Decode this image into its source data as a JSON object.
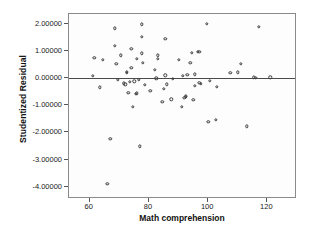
{
  "chart_data": {
    "type": "scatter",
    "title": "",
    "xlabel": "Math comprehension",
    "ylabel": "Studentized Residual",
    "xlim": [
      53,
      130
    ],
    "ylim": [
      -4.45,
      2.35
    ],
    "grid": false,
    "legend": null,
    "xticks": [
      60,
      80,
      100,
      120
    ],
    "xtick_labels": [
      "60",
      "80",
      "100",
      "120"
    ],
    "yticks": [
      2,
      1,
      0,
      -1,
      -2,
      -3,
      -4
    ],
    "ytick_labels": [
      "2.00000",
      "1.00000",
      "0.00000",
      "-1.00000",
      "-2.00000",
      "-3.00000",
      "-4.00000"
    ],
    "reference_line": {
      "orientation": "horizontal",
      "y": 0,
      "color": "#4a4a4a"
    },
    "marker": {
      "shape": "circle",
      "filled": false,
      "edge_color": "#3a3a3a",
      "size": 3.4
    },
    "points": [
      [
        61.0,
        0.07
      ],
      [
        61.5,
        0.73
      ],
      [
        63.5,
        -0.35
      ],
      [
        64.5,
        0.66
      ],
      [
        66.0,
        -3.89
      ],
      [
        67.0,
        -2.23
      ],
      [
        68.5,
        1.83
      ],
      [
        68.5,
        1.18
      ],
      [
        69.0,
        0.53
      ],
      [
        69.5,
        -0.06
      ],
      [
        70.5,
        0.83
      ],
      [
        71.5,
        -0.2
      ],
      [
        72.0,
        -0.23
      ],
      [
        72.5,
        0.23
      ],
      [
        72.5,
        0.18
      ],
      [
        73.0,
        -0.55
      ],
      [
        73.5,
        -0.15
      ],
      [
        74.0,
        1.08
      ],
      [
        74.0,
        0.37
      ],
      [
        74.5,
        -1.05
      ],
      [
        75.0,
        -0.13
      ],
      [
        75.5,
        -0.58
      ],
      [
        76.0,
        0.7
      ],
      [
        76.0,
        -0.57
      ],
      [
        76.5,
        -0.07
      ],
      [
        77.0,
        -2.51
      ],
      [
        77.5,
        1.97
      ],
      [
        77.5,
        1.51
      ],
      [
        77.5,
        0.9
      ],
      [
        78.0,
        0.56
      ],
      [
        78.5,
        -0.25
      ],
      [
        80.5,
        -0.47
      ],
      [
        82.0,
        0.3
      ],
      [
        82.5,
        -0.02
      ],
      [
        83.0,
        0.83
      ],
      [
        83.0,
        0.71
      ],
      [
        84.5,
        -0.88
      ],
      [
        85.0,
        -0.4
      ],
      [
        85.5,
        1.43
      ],
      [
        85.5,
        0.1
      ],
      [
        86.0,
        -0.23
      ],
      [
        87.5,
        -0.78
      ],
      [
        88.0,
        -0.03
      ],
      [
        90.0,
        0.67
      ],
      [
        91.0,
        -1.07
      ],
      [
        91.5,
        0.08
      ],
      [
        92.0,
        -0.72
      ],
      [
        92.5,
        -0.68
      ],
      [
        92.5,
        -0.7
      ],
      [
        93.0,
        0.12
      ],
      [
        94.0,
        0.55
      ],
      [
        94.5,
        0.93
      ],
      [
        95.0,
        -0.8
      ],
      [
        95.5,
        0.14
      ],
      [
        95.5,
        -0.3
      ],
      [
        96.5,
        0.96
      ],
      [
        97.0,
        0.97
      ],
      [
        97.0,
        -0.18
      ],
      [
        97.5,
        -0.22
      ],
      [
        99.5,
        1.98
      ],
      [
        100.0,
        -1.62
      ],
      [
        100.5,
        -0.1
      ],
      [
        102.5,
        -1.54
      ],
      [
        103.0,
        -0.32
      ],
      [
        107.5,
        0.18
      ],
      [
        110.0,
        0.21
      ],
      [
        111.0,
        0.52
      ],
      [
        113.0,
        -1.78
      ],
      [
        115.5,
        0.02
      ],
      [
        116.0,
        0.01
      ],
      [
        117.0,
        1.87
      ],
      [
        121.0,
        0.03
      ]
    ]
  }
}
